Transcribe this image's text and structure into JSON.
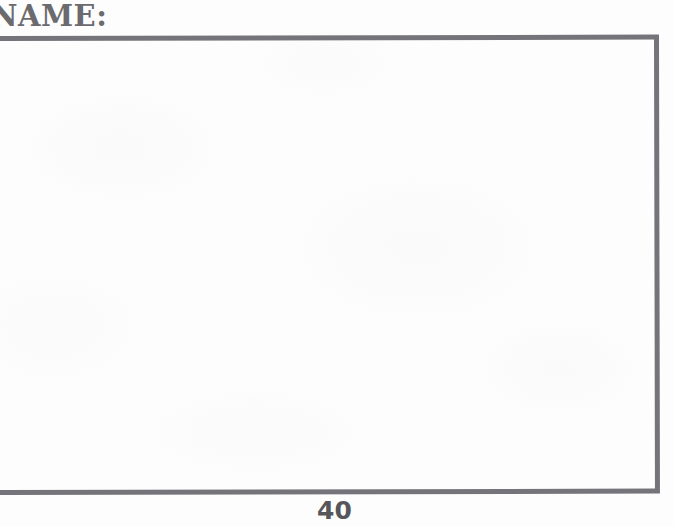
{
  "page": {
    "background_color": "#fdfdfd",
    "ink_color": "#6b6b6f",
    "rule_color": "#74747a"
  },
  "header": {
    "name_label": "NAME:",
    "name_label_clipped_left": true
  },
  "answer_box": {
    "content": "",
    "border_color": "#74747a"
  },
  "footer": {
    "page_number": "40"
  }
}
